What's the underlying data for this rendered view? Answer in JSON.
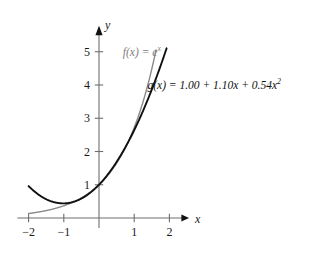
{
  "figure": {
    "type": "function-graph",
    "background": "#ffffff",
    "width": 316,
    "height": 260
  },
  "axes": {
    "x_name": "x",
    "y_name": "y",
    "x_ticks": [
      "−2",
      "−1",
      "1",
      "2"
    ],
    "x_tick_values": [
      -2,
      -1,
      1,
      2
    ],
    "y_ticks": [
      "1",
      "2",
      "3",
      "4",
      "5"
    ],
    "y_tick_values": [
      1,
      2,
      3,
      4,
      5
    ],
    "xlim": [
      -2.3,
      2.35
    ],
    "ylim": [
      -0.35,
      5.6
    ],
    "grid": false,
    "axis_color": "#6e6e6e",
    "arrow_color": "#111111"
  },
  "labels": {
    "f_label_prefix": "f(x) = e",
    "f_label_exponent": "x",
    "f_label_full": "f(x) = eˣ",
    "f_label_color": "#7d7d7d",
    "g_label_text": "g(x) = 1.00 + 1.10x + 0.54x",
    "g_label_exponent": "2",
    "g_label_full": "g(x) = 1.00 + 1.10x + 0.54x²",
    "g_label_color": "#111111"
  },
  "chart_data": {
    "type": "line",
    "title": "",
    "xlabel": "x",
    "ylabel": "y",
    "xlim": [
      -2.3,
      2.35
    ],
    "ylim": [
      -0.35,
      5.6
    ],
    "grid": false,
    "legend": "inline-curve-labels",
    "xticks": [
      -2,
      -1,
      1,
      2
    ],
    "yticks": [
      1,
      2,
      3,
      4,
      5
    ],
    "series": [
      {
        "name": "f(x) = e^x",
        "expression": "exp(x)",
        "color": "#8a8a8a",
        "width": 1.4,
        "x_start": -2.0,
        "x_end": 1.62,
        "x": [
          -2.0,
          -1.75,
          -1.5,
          -1.25,
          -1.0,
          -0.75,
          -0.5,
          -0.25,
          0.0,
          0.25,
          0.5,
          0.75,
          1.0,
          1.25,
          1.5,
          1.62
        ],
        "y": [
          0.14,
          0.17,
          0.22,
          0.29,
          0.37,
          0.47,
          0.61,
          0.78,
          1.0,
          1.28,
          1.65,
          2.12,
          2.72,
          3.49,
          4.48,
          5.05
        ]
      },
      {
        "name": "g(x) = 1.00 + 1.10x + 0.54x^2",
        "expression": "1.00 + 1.10*x + 0.54*x^2",
        "coefficients": [
          1.0,
          1.1,
          0.54
        ],
        "color": "#111111",
        "width": 1.9,
        "x_start": -2.0,
        "x_end": 1.92,
        "x": [
          -2.0,
          -1.75,
          -1.5,
          -1.25,
          -1.0,
          -0.75,
          -0.5,
          -0.25,
          0.0,
          0.25,
          0.5,
          0.75,
          1.0,
          1.25,
          1.5,
          1.75,
          1.92
        ],
        "y": [
          0.96,
          0.73,
          0.59,
          0.47,
          0.44,
          0.48,
          0.59,
          0.76,
          1.0,
          1.31,
          1.69,
          2.13,
          2.64,
          3.22,
          3.87,
          4.58,
          5.1
        ]
      }
    ],
    "annotations": [
      {
        "text": "f(x) = eˣ",
        "x": 0.35,
        "y": 5.35,
        "color": "#7d7d7d"
      },
      {
        "text": "g(x) = 1.00 + 1.10x + 0.54x²",
        "x": 1.05,
        "y": 4.35,
        "color": "#111111"
      }
    ]
  }
}
